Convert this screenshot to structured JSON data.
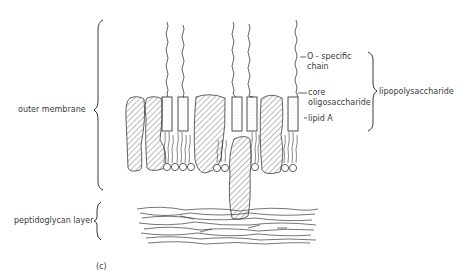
{
  "figure": {
    "panel_label": "(c)",
    "left_labels": {
      "outer_membrane": "outer membrane",
      "peptidoglycan_layer": "peptidoglycan layer"
    },
    "right_labels": {
      "o_specific_chain_line1": "O - specific",
      "o_specific_chain_line2": "chain",
      "core_line1": "core",
      "core_line2": "oligosaccharide",
      "lipid_a": "lipid  A",
      "lipopolysaccharide": "lipopolysaccharide"
    },
    "colors": {
      "ink": "#3a3a3a",
      "background": "#ffffff"
    }
  }
}
